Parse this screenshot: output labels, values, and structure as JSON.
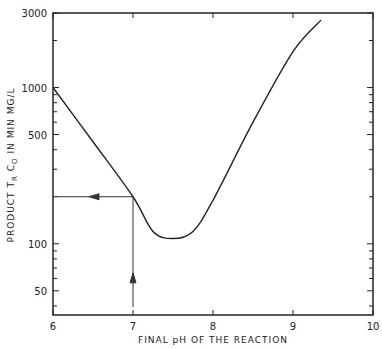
{
  "chart_data": {
    "type": "line",
    "title": "",
    "xlabel": "FINAL pH OF THE REACTION",
    "ylabel": "PRODUCT T_R C_O IN MIN MG/L",
    "ylabel_parts": {
      "main": "PRODUCT T",
      "sub1": "R",
      "mid": " C",
      "sub2": "O",
      "rest": " IN MIN MG/L"
    },
    "xlim": [
      6,
      10
    ],
    "ylim": [
      35,
      3000
    ],
    "yscale": "log",
    "x_ticks": [
      "6",
      "7",
      "8",
      "9",
      "10"
    ],
    "y_ticks": [
      "50",
      "100",
      "500",
      "1000",
      "3000"
    ],
    "grid": false,
    "series": [
      {
        "name": "TR·CO vs final pH",
        "x": [
          6.0,
          6.5,
          7.0,
          7.25,
          7.5,
          7.75,
          8.0,
          8.5,
          9.0,
          9.35
        ],
        "values": [
          1000,
          450,
          200,
          120,
          108,
          120,
          190,
          600,
          1700,
          2700
        ]
      }
    ],
    "annotations": [
      {
        "type": "arrow",
        "from": [
          7.0,
          35
        ],
        "to": [
          7.0,
          200
        ],
        "label": "vertical arrow up at pH 7"
      },
      {
        "type": "arrow",
        "from": [
          7.0,
          200
        ],
        "to": [
          6.0,
          200
        ],
        "label": "horizontal arrow left to y-axis"
      }
    ]
  }
}
